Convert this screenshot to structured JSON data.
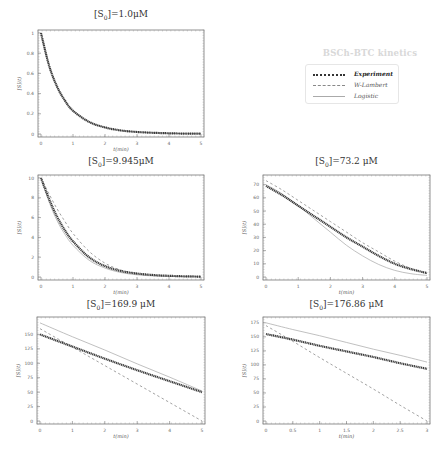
{
  "figure": {
    "legend": {
      "title": "BSCh-BTC kinetics",
      "entries": [
        {
          "label": "Experiment",
          "style": "dotted-thick",
          "color": "#333333"
        },
        {
          "label": "W-Lambert",
          "style": "dashed",
          "color": "#888888"
        },
        {
          "label": "Logistic",
          "style": "solid",
          "color": "#aaaaaa"
        }
      ]
    }
  },
  "chart_data": [
    {
      "type": "line",
      "title": "[S0]=1.0μM",
      "xlabel": "t(min)",
      "ylabel": "[S](t)",
      "xlim": [
        0,
        5
      ],
      "ylim": [
        0,
        1
      ],
      "xticks": [
        "0",
        "1",
        "2",
        "3",
        "4",
        "5"
      ],
      "yticks": [
        "0",
        "0.2",
        "0.4",
        "0.6",
        "0.8",
        "1"
      ],
      "x": [
        0,
        0.25,
        0.5,
        0.75,
        1,
        1.5,
        2,
        2.5,
        3,
        3.5,
        4,
        4.5,
        5
      ],
      "series": [
        {
          "name": "Experiment",
          "values": [
            1.0,
            0.68,
            0.47,
            0.33,
            0.23,
            0.12,
            0.065,
            0.035,
            0.02,
            0.012,
            0.007,
            0.004,
            0.003
          ]
        },
        {
          "name": "W-Lambert",
          "values": [
            1.0,
            0.68,
            0.47,
            0.33,
            0.23,
            0.12,
            0.065,
            0.035,
            0.02,
            0.012,
            0.007,
            0.004,
            0.003
          ]
        },
        {
          "name": "Logistic",
          "values": [
            1.0,
            0.68,
            0.47,
            0.33,
            0.23,
            0.12,
            0.065,
            0.035,
            0.02,
            0.012,
            0.007,
            0.004,
            0.003
          ]
        }
      ]
    },
    {
      "type": "line",
      "title": "[S0]=9.945μM",
      "xlabel": "t(min)",
      "ylabel": "[S](t)",
      "xlim": [
        0,
        5
      ],
      "ylim": [
        0,
        10
      ],
      "xticks": [
        "0",
        "1",
        "2",
        "3",
        "4",
        "5"
      ],
      "yticks": [
        "0",
        "2",
        "4",
        "6",
        "8",
        "10"
      ],
      "x": [
        0,
        0.25,
        0.5,
        0.75,
        1,
        1.5,
        2,
        2.5,
        3,
        3.5,
        4,
        4.5,
        5
      ],
      "series": [
        {
          "name": "Experiment",
          "values": [
            10.0,
            7.9,
            6.1,
            4.7,
            3.6,
            2.0,
            1.1,
            0.6,
            0.35,
            0.2,
            0.12,
            0.07,
            0.04
          ]
        },
        {
          "name": "W-Lambert",
          "values": [
            10.0,
            8.4,
            6.9,
            5.6,
            4.4,
            2.6,
            1.4,
            0.7,
            0.35,
            0.17,
            0.08,
            0.04,
            0.02
          ]
        },
        {
          "name": "Logistic",
          "values": [
            10.0,
            7.6,
            5.7,
            4.3,
            3.2,
            1.7,
            0.9,
            0.45,
            0.22,
            0.11,
            0.05,
            0.03,
            0.01
          ]
        }
      ]
    },
    {
      "type": "line",
      "title": "[S0]=73.2 μM",
      "xlabel": "t(min)",
      "ylabel": "[S](t)",
      "xlim": [
        0,
        5
      ],
      "ylim": [
        0,
        75
      ],
      "xticks": [
        "0",
        "1",
        "2",
        "3",
        "4",
        "5"
      ],
      "yticks": [
        "0",
        "10",
        "20",
        "30",
        "40",
        "50",
        "60",
        "70"
      ],
      "x": [
        0,
        0.5,
        1,
        1.5,
        2,
        2.5,
        3,
        3.5,
        4,
        4.5,
        5
      ],
      "series": [
        {
          "name": "Experiment",
          "values": [
            69,
            62,
            54,
            46,
            38,
            30,
            23,
            16,
            10,
            6,
            3
          ]
        },
        {
          "name": "W-Lambert",
          "values": [
            73,
            66,
            58,
            50,
            42,
            34,
            26,
            19,
            12,
            6.5,
            2.5
          ]
        },
        {
          "name": "Logistic",
          "values": [
            70,
            63,
            54,
            44,
            34,
            24,
            16,
            9.5,
            5,
            2.5,
            1.2
          ]
        }
      ]
    },
    {
      "type": "line",
      "title": "[S0]=169.9 μM",
      "xlabel": "t(min)",
      "ylabel": "[S](t)",
      "xlim": [
        0,
        5
      ],
      "ylim": [
        0,
        175
      ],
      "xticks": [
        "0",
        "1",
        "2",
        "3",
        "4",
        "5"
      ],
      "yticks": [
        "0",
        "25",
        "50",
        "75",
        "100",
        "125",
        "150"
      ],
      "x": [
        0,
        1,
        2,
        3,
        4,
        5
      ],
      "series": [
        {
          "name": "Experiment",
          "values": [
            150,
            129,
            108,
            88,
            69,
            50
          ]
        },
        {
          "name": "W-Lambert",
          "values": [
            160,
            128,
            96,
            64,
            32,
            0
          ]
        },
        {
          "name": "Logistic",
          "values": [
            170,
            146,
            123,
            99,
            76,
            52
          ]
        }
      ]
    },
    {
      "type": "line",
      "title": "[S0]=176.86 μM",
      "xlabel": "t(min)",
      "ylabel": "[S](t)",
      "xlim": [
        0,
        3
      ],
      "ylim": [
        0,
        180
      ],
      "xticks": [
        "0",
        "0.5",
        "1",
        "1.5",
        "2",
        "2.5",
        "3"
      ],
      "yticks": [
        "0",
        "25",
        "50",
        "75",
        "100",
        "125",
        "150",
        "175"
      ],
      "x": [
        0,
        0.5,
        1,
        1.5,
        2,
        2.5,
        3
      ],
      "series": [
        {
          "name": "Experiment",
          "values": [
            155,
            145,
            134,
            124,
            114,
            103,
            93
          ]
        },
        {
          "name": "W-Lambert",
          "values": [
            170,
            142,
            113,
            85,
            57,
            28,
            0
          ]
        },
        {
          "name": "Logistic",
          "values": [
            175,
            163,
            152,
            140,
            128,
            117,
            105
          ]
        }
      ]
    }
  ]
}
